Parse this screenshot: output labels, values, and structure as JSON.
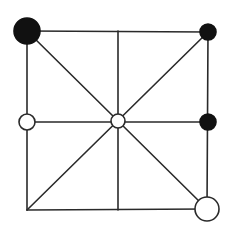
{
  "board": {
    "type": "nine-point-board",
    "line_color": "#2a2a2a",
    "black_color": "#111111",
    "white_color": "#ffffff",
    "points": [
      {
        "id": "top-left",
        "col": 0,
        "row": 0,
        "x": 27,
        "y": 31
      },
      {
        "id": "top-middle",
        "col": 1,
        "row": 0,
        "x": 118,
        "y": 31
      },
      {
        "id": "top-right",
        "col": 2,
        "row": 0,
        "x": 208,
        "y": 32
      },
      {
        "id": "middle-left",
        "col": 0,
        "row": 1,
        "x": 27,
        "y": 122
      },
      {
        "id": "center",
        "col": 1,
        "row": 1,
        "x": 118,
        "y": 121
      },
      {
        "id": "middle-right",
        "col": 2,
        "row": 1,
        "x": 208,
        "y": 122
      },
      {
        "id": "bottom-left",
        "col": 0,
        "row": 2,
        "x": 27,
        "y": 210
      },
      {
        "id": "bottom-middle",
        "col": 1,
        "row": 2,
        "x": 118,
        "y": 210
      },
      {
        "id": "bottom-right",
        "col": 2,
        "row": 2,
        "x": 207,
        "y": 209
      }
    ],
    "lines": [
      {
        "from": "top-left",
        "to": "top-right"
      },
      {
        "from": "middle-left",
        "to": "middle-right"
      },
      {
        "from": "bottom-left",
        "to": "bottom-right"
      },
      {
        "from": "top-left",
        "to": "bottom-left"
      },
      {
        "from": "top-middle",
        "to": "bottom-middle"
      },
      {
        "from": "top-right",
        "to": "bottom-right"
      },
      {
        "from": "top-left",
        "to": "bottom-right"
      },
      {
        "from": "top-right",
        "to": "bottom-left"
      }
    ],
    "pieces": [
      {
        "point": "top-left",
        "color": "black",
        "radius": 13
      },
      {
        "point": "top-right",
        "color": "black",
        "radius": 8
      },
      {
        "point": "middle-left",
        "color": "white",
        "radius": 8
      },
      {
        "point": "center",
        "color": "white",
        "radius": 7
      },
      {
        "point": "middle-right",
        "color": "black",
        "radius": 8
      },
      {
        "point": "bottom-right",
        "color": "white",
        "radius": 12
      }
    ]
  }
}
